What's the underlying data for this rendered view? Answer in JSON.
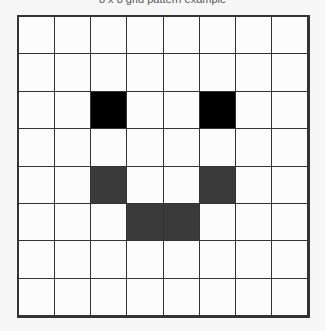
{
  "canvas": {
    "width": 325,
    "height": 331,
    "background_color": "#f7f7f7"
  },
  "caption": {
    "text": "8 x 8 grid pattern example",
    "visible": "clipped"
  },
  "grid": {
    "rows": 8,
    "columns": 8,
    "line_color": "#333333",
    "line_width_px": 2,
    "empty_cell_color": "#fcfcfc",
    "fill_colors": {
      "0": "#fcfcfc",
      "1": "#000000",
      "2": "#3a3a3a"
    },
    "legend": {
      "0": "empty",
      "1": "black",
      "2": "dark-gray"
    },
    "pattern_name": "smiley-face",
    "cells": [
      [
        0,
        0,
        0,
        0,
        0,
        0,
        0,
        0
      ],
      [
        0,
        0,
        0,
        0,
        0,
        0,
        0,
        0
      ],
      [
        0,
        0,
        1,
        0,
        0,
        1,
        0,
        0
      ],
      [
        0,
        0,
        0,
        0,
        0,
        0,
        0,
        0
      ],
      [
        0,
        0,
        2,
        0,
        0,
        2,
        0,
        0
      ],
      [
        0,
        0,
        0,
        2,
        2,
        0,
        0,
        0
      ],
      [
        0,
        0,
        0,
        0,
        0,
        0,
        0,
        0
      ],
      [
        0,
        0,
        0,
        0,
        0,
        0,
        0,
        0
      ]
    ]
  }
}
